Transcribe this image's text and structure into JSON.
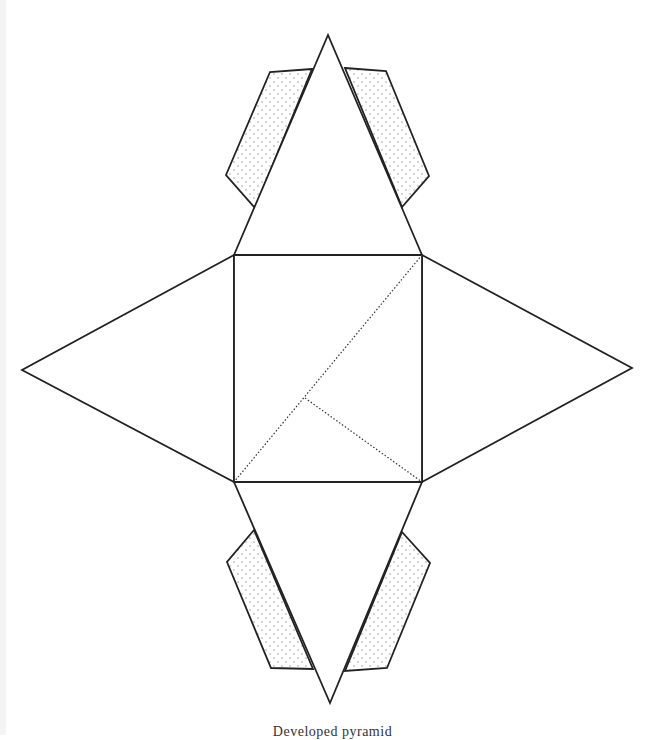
{
  "diagram": {
    "type": "pyramid-net",
    "colors": {
      "stroke": "#222222",
      "tab_dots": "#8a8a8a",
      "background": "#ffffff"
    },
    "base_square": {
      "points": [
        [
          234,
          255
        ],
        [
          422,
          255
        ],
        [
          422,
          482
        ],
        [
          234,
          482
        ]
      ]
    },
    "faces": [
      {
        "name": "top-face",
        "points": [
          [
            234,
            255
          ],
          [
            328,
            35
          ],
          [
            422,
            255
          ]
        ]
      },
      {
        "name": "left-face",
        "points": [
          [
            234,
            255
          ],
          [
            22,
            370
          ],
          [
            234,
            482
          ]
        ]
      },
      {
        "name": "right-face",
        "points": [
          [
            422,
            255
          ],
          [
            632,
            368
          ],
          [
            422,
            482
          ]
        ]
      },
      {
        "name": "bottom-face",
        "points": [
          [
            234,
            482
          ],
          [
            330,
            703
          ],
          [
            422,
            482
          ]
        ]
      }
    ],
    "tabs": [
      {
        "name": "top-left-tab",
        "points": [
          [
            312,
            69
          ],
          [
            270,
            72
          ],
          [
            226,
            175
          ],
          [
            255,
            208
          ]
        ]
      },
      {
        "name": "top-right-tab",
        "points": [
          [
            345,
            68
          ],
          [
            386,
            71
          ],
          [
            429,
            176
          ],
          [
            402,
            207
          ]
        ]
      },
      {
        "name": "bottom-left-tab",
        "points": [
          [
            254,
            530
          ],
          [
            227,
            562
          ],
          [
            271,
            668
          ],
          [
            313,
            669
          ]
        ]
      },
      {
        "name": "bottom-right-tab",
        "points": [
          [
            402,
            532
          ],
          [
            430,
            563
          ],
          [
            387,
            668
          ],
          [
            345,
            671
          ]
        ]
      }
    ],
    "fold_lines": [
      {
        "name": "diagonal-fold",
        "from": [
          422,
          255
        ],
        "to": [
          234,
          482
        ]
      },
      {
        "name": "inner-fold",
        "from": [
          305,
          398
        ],
        "to": [
          422,
          482
        ]
      }
    ]
  },
  "caption": "Developed pyramid"
}
